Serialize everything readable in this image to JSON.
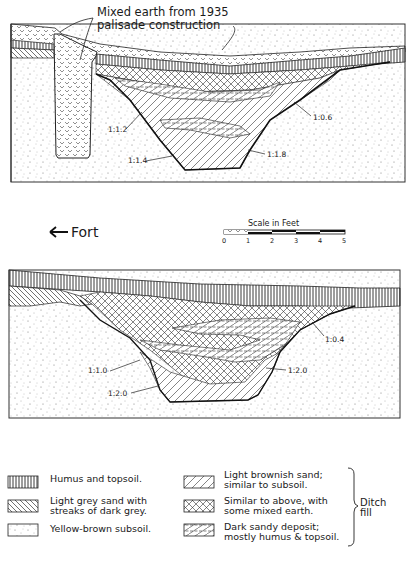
{
  "figure": {
    "top_section": {
      "annotation": [
        "Mixed earth from 1935",
        "palisade construction"
      ],
      "slope_labels": [
        {
          "id": "s1",
          "text": "1:1.2"
        },
        {
          "id": "s2",
          "text": "1:1.4"
        },
        {
          "id": "s3",
          "text": "1:1.8"
        },
        {
          "id": "s4",
          "text": "1:0.6"
        }
      ]
    },
    "direction": {
      "label": "Fort",
      "arrow": "left-arrow-icon"
    },
    "scale": {
      "title": "Scale in Feet",
      "ticks": [
        "0",
        "1",
        "2",
        "3",
        "4",
        "5"
      ]
    },
    "bottom_section": {
      "slope_labels": [
        {
          "id": "b1",
          "text": "1:1.0"
        },
        {
          "id": "b2",
          "text": "1:2.0"
        },
        {
          "id": "b3",
          "text": "1:2.0"
        },
        {
          "id": "b4",
          "text": "1:0.4"
        }
      ]
    },
    "legend": {
      "left": [
        {
          "pattern": "vertical-lines",
          "lines": [
            "Humus and topsoil."
          ]
        },
        {
          "pattern": "diagonal-back",
          "lines": [
            "Light grey sand with",
            "streaks of dark grey."
          ]
        },
        {
          "pattern": "dots",
          "lines": [
            "Yellow-brown subsoil."
          ]
        }
      ],
      "right": [
        {
          "pattern": "diagonal-forward",
          "lines": [
            "Light brownish sand;",
            "similar to subsoil."
          ]
        },
        {
          "pattern": "crosshatch",
          "lines": [
            "Similar to above, with",
            "some mixed earth."
          ]
        },
        {
          "pattern": "dashed-diagonal",
          "lines": [
            "Dark sandy deposit;",
            "mostly humus & topsoil."
          ]
        }
      ],
      "group_label": [
        "Ditch",
        "fill"
      ]
    }
  }
}
